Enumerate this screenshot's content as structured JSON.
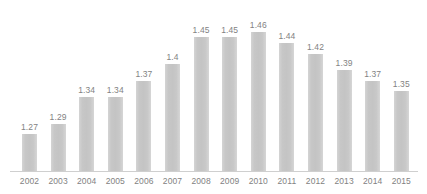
{
  "chart_data": {
    "type": "bar",
    "title": "",
    "subtitle": "",
    "xlabel": "",
    "ylabel": "",
    "categories": [
      "2002",
      "2003",
      "2004",
      "2005",
      "2006",
      "2007",
      "2008",
      "2009",
      "2010",
      "2011",
      "2012",
      "2013",
      "2014",
      "2015"
    ],
    "values": [
      1.27,
      1.29,
      1.34,
      1.34,
      1.37,
      1.4,
      1.45,
      1.45,
      1.46,
      1.44,
      1.42,
      1.39,
      1.37,
      1.35
    ],
    "data_labels": [
      "1.27",
      "1.29",
      "1.34",
      "1.34",
      "1.37",
      "1.4",
      "1.45",
      "1.45",
      "1.46",
      "1.44",
      "1.42",
      "1.39",
      "1.37",
      "1.35"
    ],
    "ylim": [
      1.2,
      1.475
    ],
    "grid": false,
    "legend": null,
    "legend_position": "none",
    "annotations": [],
    "series": [
      {
        "name": "",
        "values": [
          1.27,
          1.29,
          1.34,
          1.34,
          1.37,
          1.4,
          1.45,
          1.45,
          1.46,
          1.44,
          1.42,
          1.39,
          1.37,
          1.35
        ]
      }
    ]
  },
  "style": {
    "bar_color": "#c9c9c9",
    "label_color": "#828282",
    "axis_color": "#cfcfcf",
    "background": "#ffffff"
  }
}
